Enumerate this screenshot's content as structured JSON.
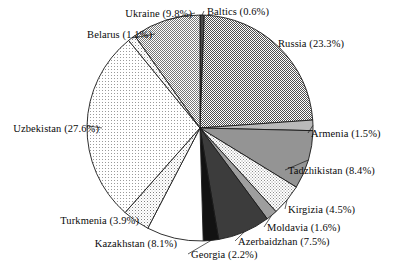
{
  "chart_data": {
    "type": "pie",
    "title": "",
    "subtitle": "",
    "xlabel": "",
    "ylabel": "",
    "legend_position": "none",
    "grid": false,
    "start_angle_deg": 0,
    "direction": "clockwise",
    "categories": [
      "Baltics",
      "Russia",
      "Armenia",
      "Tadzhikistan",
      "Kirgizia",
      "Moldavia",
      "Azerbaidzhan",
      "Georgia",
      "Kazakhstan",
      "Turkmenia",
      "Uzbekistan",
      "Belarus",
      "Ukraine"
    ],
    "values": [
      0.6,
      23.3,
      1.5,
      8.4,
      4.5,
      1.6,
      7.5,
      2.2,
      8.1,
      3.9,
      27.6,
      1.1,
      9.8
    ],
    "unit": "%",
    "slices": [
      {
        "name": "Baltics",
        "value": 0.6,
        "label": "Baltics (0.6%)",
        "fill": "#4a4a4a",
        "pattern": "solid-dark",
        "label_x": 207,
        "label_y": 6,
        "label_align": "left"
      },
      {
        "name": "Russia",
        "value": 23.3,
        "label": "Russia (23.3%)",
        "fill": "#8c8c8c",
        "pattern": "checker-dense",
        "label_x": 278,
        "label_y": 38,
        "label_align": "left"
      },
      {
        "name": "Armenia",
        "value": 1.5,
        "label": "Armenia (1.5%)",
        "fill": "#b5b5b5",
        "pattern": "solid-light",
        "label_x": 311,
        "label_y": 128,
        "label_align": "left"
      },
      {
        "name": "Tadzhikistan",
        "value": 8.4,
        "label": "Tadzhikistan (8.4%)",
        "fill": "#949494",
        "pattern": "solid-mid",
        "label_x": 288,
        "label_y": 165,
        "label_align": "left"
      },
      {
        "name": "Kirgizia",
        "value": 4.5,
        "label": "Kirgizia (4.5%)",
        "fill": "#cfcfcf",
        "pattern": "checker-light",
        "label_x": 288,
        "label_y": 204,
        "label_align": "left"
      },
      {
        "name": "Moldavia",
        "value": 1.6,
        "label": "Moldavia (1.6%)",
        "fill": "#9e9e9e",
        "pattern": "solid-mid",
        "label_x": 267,
        "label_y": 222,
        "label_align": "left"
      },
      {
        "name": "Azerbaidzhan",
        "value": 7.5,
        "label": "Azerbaidzhan (7.5%)",
        "fill": "#3a3a3a",
        "pattern": "solid-dark",
        "label_x": 238,
        "label_y": 236,
        "label_align": "left"
      },
      {
        "name": "Georgia",
        "value": 2.2,
        "label": "Georgia (2.2%)",
        "fill": "#151515",
        "pattern": "solid-black",
        "label_x": 191,
        "label_y": 249,
        "label_align": "left"
      },
      {
        "name": "Kazakhstan",
        "value": 8.1,
        "label": "Kazakhstan (8.1%)",
        "fill": "#ffffff",
        "pattern": "solid-white",
        "label_x": 177,
        "label_y": 238,
        "label_align": "right"
      },
      {
        "name": "Turkmenia",
        "value": 3.9,
        "label": "Turkmenia (3.9%)",
        "fill": "#e2e2e2",
        "pattern": "dots-light",
        "label_x": 139,
        "label_y": 215,
        "label_align": "right"
      },
      {
        "name": "Uzbekistan",
        "value": 27.6,
        "label": "Uzbekistan (27.6%)",
        "fill": "#efefef",
        "pattern": "dots-fine",
        "label_x": 99,
        "label_y": 123,
        "label_align": "right"
      },
      {
        "name": "Belarus",
        "value": 1.1,
        "label": "Belarus (1.1%)",
        "fill": "#dedede",
        "pattern": "dots-light",
        "label_x": 152,
        "label_y": 29,
        "label_align": "right"
      },
      {
        "name": "Ukraine",
        "value": 9.8,
        "label": "Ukraine (9.8%)",
        "fill": "#a8a8a8",
        "pattern": "checker-mid",
        "label_x": 192,
        "label_y": 8,
        "label_align": "right"
      }
    ],
    "geometry": {
      "center_x": 200,
      "center_y": 128,
      "radius": 113
    },
    "colors": {
      "outline": "#1a1a1a",
      "text": "#0a0a0a",
      "background": "#ffffff"
    }
  }
}
